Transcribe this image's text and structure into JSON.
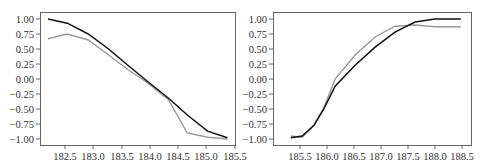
{
  "chart_data": [
    {
      "type": "line",
      "title": "",
      "xlabel": "",
      "ylabel": "",
      "xlim": [
        182.2,
        185.5
      ],
      "ylim": [
        -1.1,
        1.1
      ],
      "grid": false,
      "legend": null,
      "xticks": [
        "182.5",
        "183.0",
        "183.5",
        "184.0",
        "184.5",
        "185.0",
        "185.5"
      ],
      "yticks": [
        "1.00",
        "0.75",
        "0.50",
        "0.25",
        "0.00",
        "−0.25",
        "−0.50",
        "−0.75",
        "−1.00"
      ],
      "x": [
        182.2,
        182.54,
        182.91,
        183.27,
        183.62,
        183.97,
        184.33,
        184.66,
        185.02,
        185.37
      ],
      "series": [
        {
          "name": "black",
          "color": "#111111",
          "values": [
            1.0,
            0.93,
            0.75,
            0.5,
            0.22,
            -0.05,
            -0.32,
            -0.6,
            -0.87,
            -0.98
          ]
        },
        {
          "name": "gray",
          "color": "#999999",
          "values": [
            0.67,
            0.75,
            0.65,
            0.4,
            0.15,
            -0.07,
            -0.35,
            -0.9,
            -0.97,
            -1.0
          ]
        }
      ]
    },
    {
      "type": "line",
      "title": "",
      "xlabel": "",
      "ylabel": "",
      "xlim": [
        185.3,
        188.6
      ],
      "ylim": [
        -1.1,
        1.1
      ],
      "grid": false,
      "legend": null,
      "xticks": [
        "185.5",
        "186.0",
        "186.5",
        "187.0",
        "187.5",
        "188.0",
        "188.5"
      ],
      "yticks": [
        "1.00",
        "0.75",
        "0.50",
        "0.25",
        "0.00",
        "−0.25",
        "−0.50",
        "−0.75",
        "−1.00"
      ],
      "x": [
        185.33,
        185.54,
        185.76,
        185.94,
        186.15,
        186.52,
        186.89,
        187.26,
        187.63,
        188.0,
        188.48
      ],
      "series": [
        {
          "name": "black",
          "color": "#111111",
          "values": [
            -0.98,
            -0.95,
            -0.77,
            -0.5,
            -0.12,
            0.23,
            0.53,
            0.78,
            0.95,
            1.0,
            1.0
          ]
        },
        {
          "name": "gray",
          "color": "#999999",
          "values": [
            -0.95,
            -0.97,
            -0.77,
            -0.48,
            0.0,
            0.4,
            0.7,
            0.88,
            0.9,
            0.87,
            0.87
          ]
        }
      ]
    }
  ],
  "charts": {
    "left": {
      "xticks": [
        "182.5",
        "183.0",
        "183.5",
        "184.0",
        "184.5",
        "185.0",
        "185.5"
      ],
      "yticks": [
        "1.00",
        "0.75",
        "0.50",
        "0.25",
        "0.00",
        "−0.25",
        "−0.50",
        "−0.75",
        "−1.00"
      ]
    },
    "right": {
      "xticks": [
        "185.5",
        "186.0",
        "186.5",
        "187.0",
        "187.5",
        "188.0",
        "188.5"
      ],
      "yticks": [
        "1.00",
        "0.75",
        "0.50",
        "0.25",
        "0.00",
        "−0.25",
        "−0.50",
        "−0.75",
        "−1.00"
      ]
    }
  }
}
